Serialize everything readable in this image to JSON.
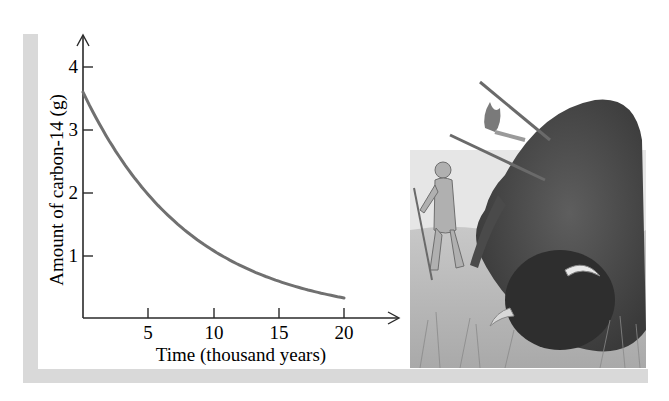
{
  "chart_data": {
    "type": "line",
    "title": "",
    "xlabel": "Time (thousand years)",
    "ylabel": "Amount of carbon-14 (g)",
    "x_ticks": [
      "5",
      "10",
      "15",
      "20"
    ],
    "y_ticks": [
      "1",
      "2",
      "3",
      "4"
    ],
    "xlim": [
      0,
      23
    ],
    "ylim": [
      0,
      4.5
    ],
    "grid": false,
    "legend": null,
    "series": [
      {
        "name": "Carbon-14 remaining",
        "color": "#707070",
        "x": [
          0,
          2.5,
          5,
          7.5,
          10,
          12.5,
          15,
          17.5,
          20
        ],
        "y": [
          3.6,
          2.65,
          1.97,
          1.45,
          1.07,
          0.79,
          0.59,
          0.43,
          0.32
        ]
      }
    ],
    "annotations": []
  },
  "illustration": {
    "description": "Pencil sketch of prehistoric hunters with spears and a wounded bison",
    "name": "bison-hunt-illustration"
  },
  "colors": {
    "frame": "#d9d9d9",
    "axis": "#2a2a2a",
    "curve": "#707070"
  }
}
